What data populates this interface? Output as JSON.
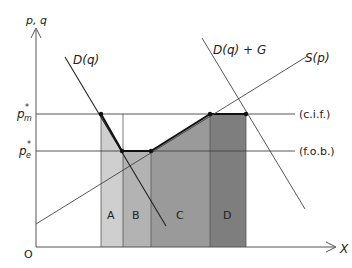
{
  "diagram": {
    "type": "economics-trade-diagram",
    "axes": {
      "y_label": "p, q",
      "x_label": "X",
      "origin_label": "O"
    },
    "price_levels": {
      "pm": {
        "symbol": "p",
        "superscript": "*",
        "subscript": "m",
        "annotation": "(c.i.f.)"
      },
      "pe": {
        "symbol": "p",
        "superscript": "*",
        "subscript": "e",
        "annotation": "(f.o.b.)"
      }
    },
    "curves": {
      "demand": "D(q)",
      "demand_plus_g": "D(q) + G",
      "supply": "S(p)"
    },
    "regions": [
      {
        "label": "A",
        "color": "#cfcfcf"
      },
      {
        "label": "B",
        "color": "#b3b3b3"
      },
      {
        "label": "C",
        "color": "#9a9a9a"
      },
      {
        "label": "D",
        "color": "#7e7e7e"
      }
    ],
    "colors": {
      "line": "#333333",
      "axis": "#555555"
    }
  }
}
